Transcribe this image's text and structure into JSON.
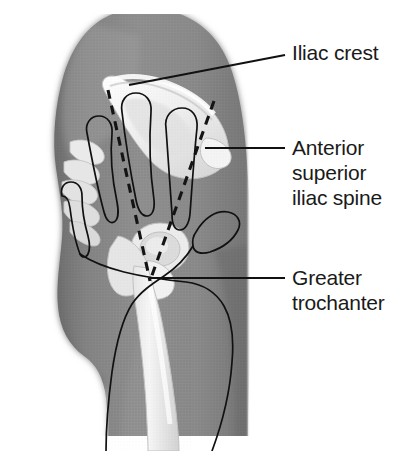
{
  "figure": {
    "kind": "anatomical-illustration",
    "view": "lateral",
    "style": "grayscale halftone medical illustration",
    "colors": {
      "page_background": "#ffffff",
      "body_silhouette": "#8a8a8a",
      "body_shadow": "#6f6f6f",
      "body_highlight": "#a8a8a8",
      "bone": "#f0f0f0",
      "bone_shadow": "#cfcfcf",
      "bone_edge": "#bdbdbd",
      "line_ink": "#111111",
      "text_ink": "#1a1a1a"
    }
  },
  "labels": [
    {
      "id": "iliac-crest",
      "lines": [
        "Iliac crest"
      ],
      "text_x": 292,
      "text_y": 60,
      "leader": {
        "type": "polyline",
        "points": "129,85 285,55"
      }
    },
    {
      "id": "anterior-superior-iliac-spine",
      "lines": [
        "Anterior",
        "superior",
        "iliac spine"
      ],
      "text_x": 292,
      "text_y": 155,
      "leader": {
        "type": "polyline",
        "points": "205,148 285,148"
      }
    },
    {
      "id": "greater-trochanter",
      "lines": [
        "Greater",
        "trochanter"
      ],
      "text_x": 292,
      "text_y": 285,
      "leader": {
        "type": "polyline",
        "points": "150,278 285,278"
      }
    }
  ],
  "label_typography": {
    "font_size_px": 21,
    "line_height_px": 25
  },
  "guides": {
    "description": "two dashed lines converging in a V at the greater trochanter",
    "left_dashed": "108,90 150,281",
    "right_dashed": "214,101 150,281",
    "convergence_point": {
      "x": 150,
      "y": 281
    }
  },
  "annotations": {
    "hand_overlay": "outline of a hand with four fingers splayed across the ilium and thumb extending laterally",
    "bones_depicted": [
      "ilium",
      "iliac crest",
      "sacrum",
      "coccyx",
      "acetabulum",
      "greater trochanter",
      "femoral shaft"
    ]
  }
}
